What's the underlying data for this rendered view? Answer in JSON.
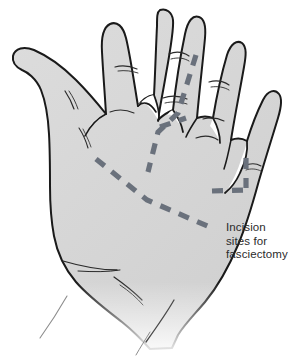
{
  "figure": {
    "view": "palmar surface of left hand"
  },
  "annotation": {
    "label": "Incision\nsites for\nfasciectomy",
    "line_1": "Incision",
    "line_2": "sites for",
    "line_3": "fasciectomy",
    "color": "#2b2b2b"
  },
  "colors": {
    "background": "#ffffff",
    "skin_fill": "#d5d5d5",
    "skin_fill_light": "#dedede",
    "outline": "#1a1a1a",
    "crease": "#2a2a2a",
    "incision_dash": "#6a717c",
    "fade": "#ffffff"
  },
  "incisions": [
    {
      "name": "transverse-palmar-incision",
      "description": "Long dashed chevron across distal palm from thenar side to ulnar border"
    },
    {
      "name": "ring-finger-longitudinal-incision",
      "description": "Dashed line running proximally to distally along the ring finger"
    },
    {
      "name": "little-finger-l-incision",
      "description": "L-shaped dashed incision at base of little finger"
    }
  ],
  "anatomy": {
    "digits": [
      "thumb",
      "index",
      "middle",
      "ring",
      "little"
    ]
  },
  "strokes": {
    "outline_width": 2.0,
    "crease_width": 1.1,
    "dash_width": 5.2,
    "dash_pattern": "11 9"
  }
}
